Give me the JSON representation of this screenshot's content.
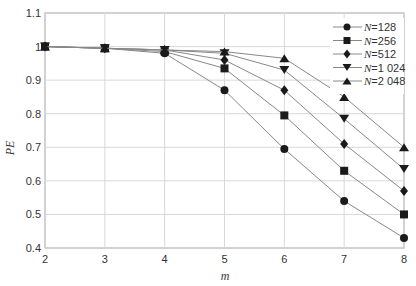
{
  "chart_data": {
    "type": "line",
    "title": "",
    "xlabel": "m",
    "ylabel": "PE",
    "x": [
      2,
      3,
      4,
      5,
      6,
      7,
      8
    ],
    "xlim": [
      2,
      8
    ],
    "ylim": [
      0.4,
      1.1
    ],
    "xticks": [
      "2",
      "3",
      "4",
      "5",
      "6",
      "7",
      "8"
    ],
    "yticks": [
      "0.4",
      "0.5",
      "0.6",
      "0.7",
      "0.8",
      "0.9",
      "1",
      "1.1"
    ],
    "grid": true,
    "legend_position": "upper right",
    "series": [
      {
        "name": "N=128",
        "marker": "circle",
        "values": [
          1.0,
          0.995,
          0.98,
          0.87,
          0.695,
          0.54,
          0.43
        ]
      },
      {
        "name": "N=256",
        "marker": "square",
        "values": [
          1.0,
          0.995,
          0.985,
          0.935,
          0.795,
          0.63,
          0.5
        ]
      },
      {
        "name": "N=512",
        "marker": "diamond",
        "values": [
          1.0,
          0.995,
          0.99,
          0.96,
          0.87,
          0.71,
          0.57
        ]
      },
      {
        "name": "N=1 024",
        "marker": "triangle-down",
        "values": [
          1.0,
          0.995,
          0.99,
          0.98,
          0.93,
          0.785,
          0.635
        ]
      },
      {
        "name": "N=2 048",
        "marker": "triangle-up",
        "values": [
          1.0,
          0.995,
          0.99,
          0.985,
          0.965,
          0.85,
          0.7
        ]
      }
    ]
  },
  "colors": {
    "line": "#888888",
    "marker": "#1a1a1a",
    "grid": "#d8d8d8",
    "axis": "#999999"
  }
}
